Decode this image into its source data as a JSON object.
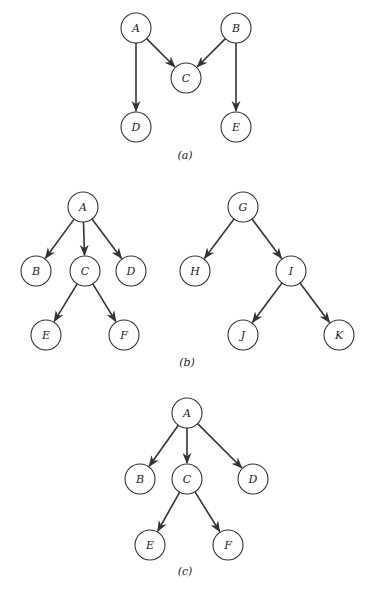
{
  "figure": {
    "panels": [
      {
        "id": "a",
        "caption": "(a)",
        "caption_pos": [
          185,
          159
        ],
        "nodes": [
          {
            "label": "A",
            "x": 136,
            "y": 28
          },
          {
            "label": "B",
            "x": 236,
            "y": 28
          },
          {
            "label": "C",
            "x": 186,
            "y": 78
          },
          {
            "label": "D",
            "x": 136,
            "y": 127
          },
          {
            "label": "E",
            "x": 236,
            "y": 127
          }
        ],
        "edges": [
          [
            "A",
            "C"
          ],
          [
            "A",
            "D"
          ],
          [
            "B",
            "C"
          ],
          [
            "B",
            "E"
          ]
        ]
      },
      {
        "id": "b",
        "caption": "(b)",
        "caption_pos": [
          187,
          366
        ],
        "trees": [
          {
            "nodes": [
              {
                "label": "A",
                "x": 83,
                "y": 207
              },
              {
                "label": "B",
                "x": 36,
                "y": 271
              },
              {
                "label": "C",
                "x": 85,
                "y": 271
              },
              {
                "label": "D",
                "x": 131,
                "y": 271
              },
              {
                "label": "E",
                "x": 46,
                "y": 335
              },
              {
                "label": "F",
                "x": 124,
                "y": 335
              }
            ],
            "edges": [
              [
                "A",
                "B"
              ],
              [
                "A",
                "C"
              ],
              [
                "A",
                "D"
              ],
              [
                "C",
                "E"
              ],
              [
                "C",
                "F"
              ]
            ]
          },
          {
            "nodes": [
              {
                "label": "G",
                "x": 243,
                "y": 207
              },
              {
                "label": "H",
                "x": 195,
                "y": 271
              },
              {
                "label": "I",
                "x": 291,
                "y": 271
              },
              {
                "label": "J",
                "x": 243,
                "y": 335
              },
              {
                "label": "K",
                "x": 339,
                "y": 335
              }
            ],
            "edges": [
              [
                "G",
                "H"
              ],
              [
                "G",
                "I"
              ],
              [
                "I",
                "J"
              ],
              [
                "I",
                "K"
              ]
            ]
          }
        ]
      },
      {
        "id": "c",
        "caption": "(c)",
        "caption_pos": [
          185,
          575
        ],
        "nodes": [
          {
            "label": "A",
            "x": 187,
            "y": 413
          },
          {
            "label": "B",
            "x": 140,
            "y": 479
          },
          {
            "label": "C",
            "x": 187,
            "y": 479
          },
          {
            "label": "D",
            "x": 253,
            "y": 479
          },
          {
            "label": "E",
            "x": 150,
            "y": 545
          },
          {
            "label": "F",
            "x": 228,
            "y": 545
          }
        ],
        "edges": [
          [
            "A",
            "B"
          ],
          [
            "A",
            "C"
          ],
          [
            "A",
            "D"
          ],
          [
            "C",
            "E"
          ],
          [
            "C",
            "F"
          ]
        ]
      }
    ],
    "node_radius": 15,
    "colors": {
      "stroke": "#333333",
      "fill": "#ffffff",
      "text": "#222222"
    }
  }
}
